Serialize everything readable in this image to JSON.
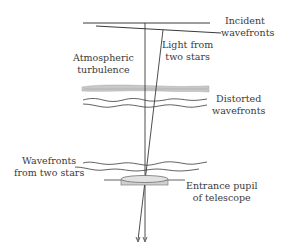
{
  "diagram": {
    "labels": {
      "incident": {
        "line1": "Incident",
        "line2": "wavefronts"
      },
      "light": {
        "line1": "Light from",
        "line2": "two stars"
      },
      "turbulence": {
        "line1": "Atmospheric",
        "line2": "turbulence"
      },
      "distorted": {
        "line1": "Distorted",
        "line2": "wavefronts"
      },
      "two_stars": {
        "line1": "Wavefronts",
        "line2": "from two stars"
      },
      "pupil": {
        "line1": "Entrance pupil",
        "line2": "of telescope"
      }
    },
    "colors": {
      "line": "#3a3a3a",
      "turbulence_fill": "#c8c8c8",
      "lens_fill": "#d9d9d9",
      "background": "#ffffff"
    }
  }
}
